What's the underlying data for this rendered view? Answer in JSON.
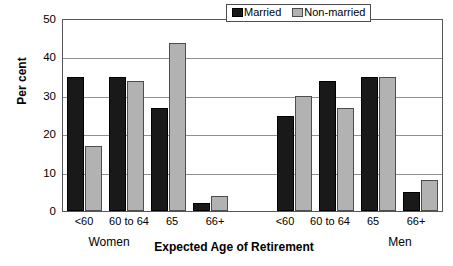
{
  "chart_data": {
    "type": "bar",
    "title": "",
    "xlabel": "Expected Age of Retirement",
    "ylabel": "Per cent",
    "ylim": [
      0,
      50
    ],
    "yticks": [
      0,
      10,
      20,
      30,
      40,
      50
    ],
    "grid": true,
    "legend_position": "top-right",
    "categories": [
      "<60",
      "60 to 64",
      "65",
      "66+",
      "",
      "<60",
      "60 to 64",
      "65",
      "66+"
    ],
    "group_labels": [
      "Women",
      "Men"
    ],
    "series": [
      {
        "name": "Married",
        "color": "#191919",
        "values": [
          35,
          35,
          27,
          2,
          null,
          25,
          34,
          35,
          5
        ]
      },
      {
        "name": "Non-married",
        "color": "#b2b2b2",
        "values": [
          17,
          34,
          44,
          4,
          null,
          30,
          27,
          35,
          8
        ]
      }
    ],
    "groups": [
      {
        "label": "Women",
        "bars": [
          {
            "category": "<60",
            "married": 35,
            "non_married": 17
          },
          {
            "category": "60 to 64",
            "married": 35,
            "non_married": 34
          },
          {
            "category": "65",
            "married": 27,
            "non_married": 44
          },
          {
            "category": "66+",
            "married": 2,
            "non_married": 4
          }
        ]
      },
      {
        "label": "Men",
        "bars": [
          {
            "category": "<60",
            "married": 25,
            "non_married": 30
          },
          {
            "category": "60 to 64",
            "married": 34,
            "non_married": 27
          },
          {
            "category": "65",
            "married": 35,
            "non_married": 35
          },
          {
            "category": "66+",
            "married": 5,
            "non_married": 8
          }
        ]
      }
    ]
  },
  "legend": {
    "items": [
      {
        "label": "Married",
        "swatch": "dark-swatch"
      },
      {
        "label": "Non-married",
        "swatch": "light-swatch"
      }
    ]
  },
  "axes": {
    "y_title": "Per cent",
    "x_title": "Expected Age of Retirement",
    "y_tick_labels": [
      "50",
      "40",
      "30",
      "20",
      "10",
      "0"
    ],
    "x_tick_labels": [
      "<60",
      "60 to 64",
      "65",
      "66+",
      "<60",
      "60 to 64",
      "65",
      "66+"
    ]
  }
}
